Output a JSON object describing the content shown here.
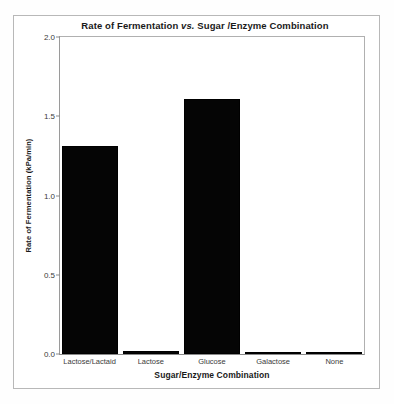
{
  "chart_data": {
    "type": "bar",
    "title": "Rate of Fermentation vs. Sugar /Enzyme Combination",
    "title_parts": {
      "before": "Rate of Fermentation ",
      "italic": "vs.",
      "after": " Sugar /Enzyme Combination"
    },
    "xlabel": "Sugar/Enzyme Combination",
    "ylabel": "Rate of Fermentation (kPa/min)",
    "categories": [
      "Lactose/Lactaid",
      "Lactose",
      "Glucose",
      "Galactose",
      "None"
    ],
    "values": [
      1.31,
      0.02,
      1.61,
      0.01,
      0.01
    ],
    "ylim": [
      0.0,
      2.0
    ],
    "yticks": [
      "0.0",
      "0.5",
      "1.0",
      "1.5",
      "2.0"
    ],
    "ytick_values": [
      0.0,
      0.5,
      1.0,
      1.5,
      2.0
    ],
    "grid": false,
    "legend": false,
    "bar_color": "#050505",
    "frame_color": "#b8b8b8",
    "axis_color": "#8a8a8a"
  }
}
